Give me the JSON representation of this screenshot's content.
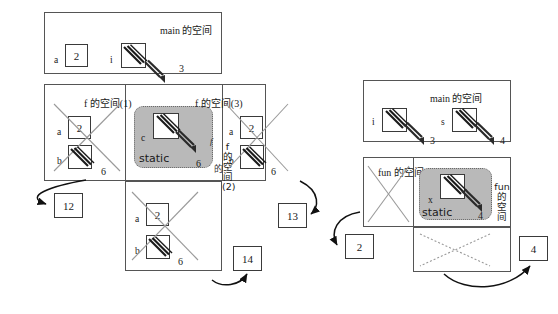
{
  "diagram": {
    "title_main_left": "main 的空间",
    "title_main_right": "main 的空间",
    "f_space_1": "f 的空间(1)",
    "f_space_3": "f 的空间(3)",
    "f_space_2_vertical": [
      "f",
      "的",
      "空",
      "间",
      "(2)"
    ],
    "fun_space_1": "fun 的空间(1)",
    "fun_space_vertical": [
      "fun",
      "的",
      "空",
      "间"
    ],
    "static_label_left": "static",
    "static_label_right": "static",
    "vars": {
      "a": "a",
      "b": "b",
      "c": "c",
      "i": "i",
      "s": "s",
      "x": "x",
      "f": "f"
    },
    "values": {
      "main_left_a": "2",
      "main_left_i": "3",
      "f1_a": "2",
      "f1_b": "6",
      "static_left_c": "6",
      "f3_a": "2",
      "f3_b": "6",
      "f2_a": "2",
      "f2_b": "6",
      "main_right_i": "3",
      "main_right_s": "4",
      "static_right_x": "4"
    },
    "result_boxes": {
      "left_12": "12",
      "mid_13": "13",
      "mid_14": "14",
      "right_2": "2",
      "right_4": "4"
    },
    "colors": {
      "static_fill": "#b9b9b9",
      "static_border": "#6a6a6a",
      "panel_border": "#555555",
      "box_border": "#3a3a3a",
      "strike": "#8d8d8d",
      "arrow": "#111111"
    }
  }
}
